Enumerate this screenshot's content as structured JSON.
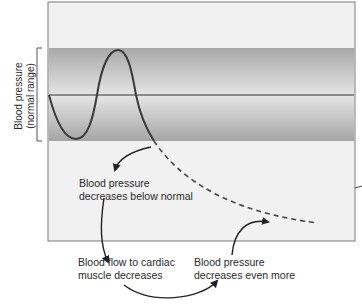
{
  "y_axis": {
    "label_line1": "Blood pressure",
    "label_line2": "(normal range)"
  },
  "labels": {
    "step1_line1": "Blood pressure",
    "step1_line2": "decreases below normal",
    "step2_line1": "Blood flow to cardiac",
    "step2_line2": "muscle decreases",
    "step3_line1": "Blood pressure",
    "step3_line2": "decreases even more"
  },
  "colors": {
    "band_dark": "#a9a9a9",
    "band_light": "#e6e6e6",
    "background": "#f1f1f1",
    "line": "#3a3a3a"
  }
}
